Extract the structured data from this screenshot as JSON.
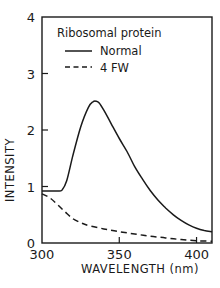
{
  "chart_data": {
    "type": "line",
    "title": "",
    "xlabel": "WAVELENGTH (nm)",
    "ylabel": "INTENSITY",
    "xlim": [
      300,
      410
    ],
    "ylim": [
      0,
      4
    ],
    "xticks": [
      300,
      350,
      400
    ],
    "yticks": [
      0,
      1,
      2,
      3,
      4
    ],
    "grid": false,
    "legend": {
      "title": "Ribosomal protein",
      "position": "upper-left-inside",
      "entries": [
        "Normal",
        "4 FW"
      ]
    },
    "series": [
      {
        "name": "Normal",
        "style": "solid",
        "x": [
          300,
          305,
          310,
          313,
          316,
          320,
          325,
          330,
          333,
          335,
          337,
          340,
          345,
          350,
          355,
          360,
          365,
          370,
          375,
          380,
          385,
          390,
          395,
          400,
          405,
          410
        ],
        "y": [
          0.92,
          0.92,
          0.92,
          0.94,
          1.1,
          1.55,
          2.05,
          2.4,
          2.5,
          2.51,
          2.48,
          2.35,
          2.1,
          1.85,
          1.62,
          1.35,
          1.13,
          0.93,
          0.76,
          0.62,
          0.5,
          0.4,
          0.32,
          0.26,
          0.22,
          0.2
        ]
      },
      {
        "name": "4 FW",
        "style": "dashed",
        "x": [
          300,
          305,
          310,
          315,
          320,
          325,
          330,
          340,
          350,
          360,
          370,
          380,
          390,
          400,
          410
        ],
        "y": [
          0.87,
          0.8,
          0.68,
          0.55,
          0.43,
          0.36,
          0.31,
          0.25,
          0.2,
          0.16,
          0.12,
          0.09,
          0.06,
          0.04,
          0.03
        ]
      }
    ]
  }
}
